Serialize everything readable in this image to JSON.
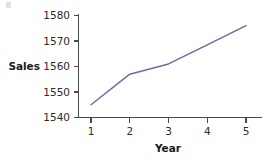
{
  "chart_data": {
    "type": "line",
    "title": "",
    "xlabel": "Year",
    "ylabel": "Sales",
    "x": [
      1,
      2,
      3,
      4,
      5
    ],
    "values": [
      1545,
      1557,
      1561,
      1568.5,
      1576
    ],
    "categories": [
      "1",
      "2",
      "3",
      "4",
      "5"
    ],
    "xtick_labels": [
      "1",
      "2",
      "3",
      "4",
      "5"
    ],
    "ytick_labels": [
      "1540",
      "1550",
      "1560",
      "1570",
      "1580"
    ],
    "yticks": [
      1540,
      1550,
      1560,
      1570,
      1580
    ],
    "xlim": [
      0.65,
      5.4
    ],
    "ylim": [
      1540,
      1580
    ],
    "grid": false,
    "legend": null,
    "series": [
      {
        "name": "Sales",
        "values": [
          1545,
          1557,
          1561,
          1568.5,
          1576
        ],
        "color": "#6b6ba8"
      }
    ],
    "line_color": "#6b6ba8",
    "axis_color": "#4a4a4a",
    "text_color": "#2b2b2b",
    "background": "#ffffff"
  },
  "labels": {
    "y_axis_title": "Sales",
    "x_axis_title": "Year",
    "ytick_0": "1540",
    "ytick_1": "1550",
    "ytick_2": "1560",
    "ytick_3": "1570",
    "ytick_4": "1580",
    "xtick_0": "1",
    "xtick_1": "2",
    "xtick_2": "3",
    "xtick_3": "4",
    "xtick_4": "5"
  }
}
